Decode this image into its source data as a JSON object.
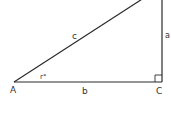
{
  "diagram": {
    "type": "right-triangle",
    "stroke_color": "#2b2b2b",
    "text_color": "#333333",
    "vertices": {
      "A": {
        "label": "A",
        "x": 14,
        "y": 82
      },
      "C": {
        "label": "C",
        "x": 162,
        "y": 82
      },
      "B_top": {
        "x": 162,
        "y": -6
      }
    },
    "sides": {
      "hypotenuse": {
        "label": "c"
      },
      "opposite": {
        "label": "a"
      },
      "adjacent": {
        "label": "b"
      }
    },
    "angle_label": "r°",
    "right_angle_marker_at": "C"
  }
}
